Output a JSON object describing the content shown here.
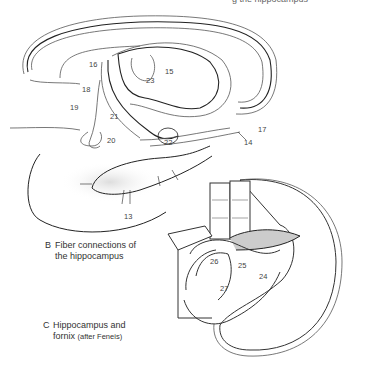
{
  "header": {
    "partial_title": "g the hippocampus"
  },
  "figure_b": {
    "caption_letter": "B",
    "caption_line1": "Fiber connections of",
    "caption_line2": "the hippocampus",
    "labels": [
      {
        "id": "13",
        "x": 124,
        "y": 213
      },
      {
        "id": "14",
        "x": 244,
        "y": 139
      },
      {
        "id": "15",
        "x": 165,
        "y": 68
      },
      {
        "id": "16",
        "x": 89,
        "y": 61
      },
      {
        "id": "17",
        "x": 258,
        "y": 126
      },
      {
        "id": "18",
        "x": 82,
        "y": 86
      },
      {
        "id": "19",
        "x": 70,
        "y": 104
      },
      {
        "id": "20",
        "x": 107,
        "y": 137
      },
      {
        "id": "21",
        "x": 110,
        "y": 113
      },
      {
        "id": "22",
        "x": 164,
        "y": 139
      },
      {
        "id": "23",
        "x": 146,
        "y": 77
      }
    ]
  },
  "figure_c": {
    "caption_letter": "C",
    "caption_line1": "Hippocampus and",
    "caption_line2": "fornix",
    "caption_note": "(after Feneis)",
    "labels": [
      {
        "id": "24",
        "x": 259,
        "y": 273
      },
      {
        "id": "25",
        "x": 238,
        "y": 262
      },
      {
        "id": "26",
        "x": 210,
        "y": 258
      },
      {
        "id": "27",
        "x": 220,
        "y": 285
      }
    ]
  }
}
